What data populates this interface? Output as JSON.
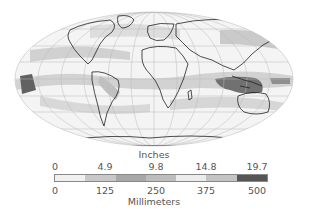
{
  "map": {
    "projection": "Mollweide world",
    "subject": "Precipitation",
    "scale_colors": [
      "#f0f0f0",
      "#c8c8c8",
      "#a8a8a8",
      "#bdbdbd",
      "#e8e8e8",
      "#c4c4c4",
      "#555555"
    ]
  },
  "legend": {
    "top_title": "Inches",
    "top_ticks": [
      "0",
      "4.9",
      "9.8",
      "14.8",
      "19.7"
    ],
    "bottom_ticks": [
      "0",
      "125",
      "250",
      "375",
      "500"
    ],
    "bottom_title": "Millimeters"
  }
}
